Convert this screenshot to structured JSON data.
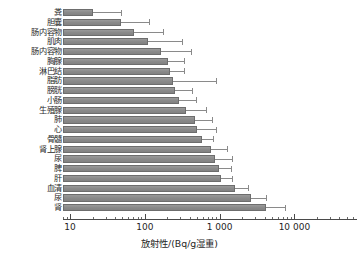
{
  "chart_data": {
    "type": "bar",
    "orientation": "horizontal",
    "title": "",
    "xlabel": "放射性/(Bq/g湿重)",
    "ylabel": "",
    "xscale": "log",
    "xlim": [
      7,
      30000
    ],
    "grid": false,
    "legend": null,
    "bar_color": "#8f8f8f",
    "error_bars": true,
    "xticks": [
      10,
      100,
      1000,
      10000
    ],
    "xticklabels": [
      "10",
      "100",
      "1 000",
      "10 000"
    ],
    "categories": [
      "粪",
      "胆囊",
      "肠内容物",
      "肌肉",
      "肠内容物",
      "胸腺",
      "淋巴结",
      "脂肪",
      "膀胱",
      "小肠",
      "生殖腺",
      "肺",
      "心",
      "骨髓",
      "肾上腺",
      "尿",
      "脾",
      "肝",
      "血清",
      "尿",
      "肾"
    ],
    "values": [
      20,
      48,
      72,
      110,
      165,
      205,
      215,
      240,
      250,
      290,
      360,
      470,
      500,
      590,
      760,
      880,
      980,
      1050,
      1600,
      2600,
      4200
    ],
    "errors_upper": [
      48,
      115,
      175,
      310,
      420,
      330,
      330,
      900,
      430,
      480,
      650,
      780,
      900,
      820,
      1250,
      1450,
      1400,
      1450,
      2400,
      4200,
      7500
    ]
  }
}
